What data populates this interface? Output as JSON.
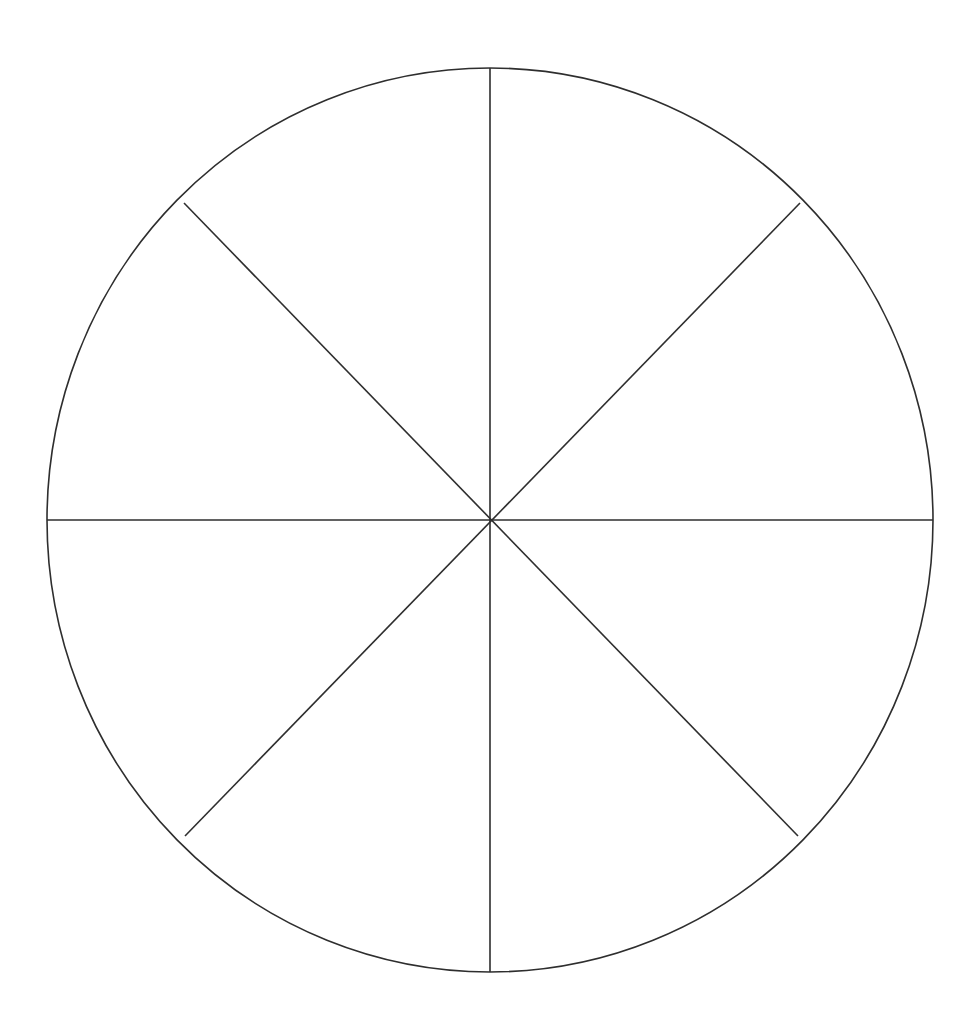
{
  "page": {
    "background_color": "#ffffff",
    "width": 980,
    "height": 1017
  },
  "figure": {
    "name": "blank-pie-chart",
    "line_color": "#2e2e2e",
    "line_width": 1.6,
    "fill_color": "none",
    "center_x": 490,
    "center_y": 520,
    "radius_x": 443,
    "radius_y": 452,
    "sector_count": 8,
    "sector_angle_degrees": 45,
    "divider_angles_degrees": [
      0,
      45,
      90,
      135,
      180,
      225,
      270,
      315
    ],
    "diameter_count": 4,
    "labels": []
  },
  "chart_data": {
    "type": "pie",
    "title": "",
    "subtitle": "",
    "xlabel": "",
    "ylabel": "",
    "grid": false,
    "legend": false,
    "legend_position": "none",
    "categories": [
      "Sector 1",
      "Sector 2",
      "Sector 3",
      "Sector 4",
      "Sector 5",
      "Sector 6",
      "Sector 7",
      "Sector 8"
    ],
    "values": [
      12.5,
      12.5,
      12.5,
      12.5,
      12.5,
      12.5,
      12.5,
      12.5
    ],
    "value_unit": "percent",
    "data_labels": [],
    "annotations": [],
    "colors": [
      "none",
      "none",
      "none",
      "none",
      "none",
      "none",
      "none",
      "none"
    ],
    "stroke_color": "#2e2e2e"
  },
  "geometry": {
    "circle": {
      "cx": 490,
      "cy": 520,
      "rx": 443,
      "ry": 452
    },
    "diameters": [
      {
        "name": "vertical-diameter",
        "x1": 490,
        "y1": 68,
        "x2": 490,
        "y2": 972
      },
      {
        "name": "horizontal-diameter",
        "x1": 47,
        "y1": 520,
        "x2": 933,
        "y2": 520
      },
      {
        "name": "diagonal-nw-se",
        "x1": 184,
        "y1": 203,
        "x2": 798,
        "y2": 836
      },
      {
        "name": "diagonal-ne-sw",
        "x1": 800,
        "y1": 203,
        "x2": 185,
        "y2": 836
      }
    ]
  }
}
